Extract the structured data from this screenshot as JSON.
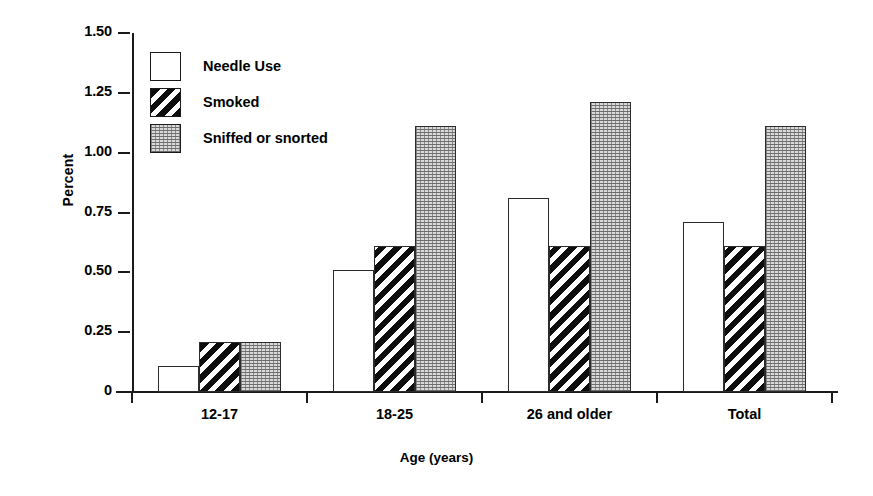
{
  "chart_data": {
    "type": "bar",
    "title": "",
    "xlabel": "Age (years)",
    "ylabel": "Percent",
    "categories": [
      "12-17",
      "18-25",
      "26 and older",
      "Total"
    ],
    "series": [
      {
        "name": "Needle Use",
        "fill": "plain",
        "values": [
          0.11,
          0.51,
          0.81,
          0.71
        ]
      },
      {
        "name": "Smoked",
        "fill": "hatch",
        "values": [
          0.21,
          0.61,
          0.61,
          0.61
        ]
      },
      {
        "name": "Sniffed or snorted",
        "fill": "stipple",
        "values": [
          0.21,
          1.11,
          1.21,
          1.11
        ]
      }
    ],
    "ylim": [
      0,
      1.5
    ],
    "yticks": [
      0,
      0.25,
      0.5,
      0.75,
      1.0,
      1.25,
      1.5
    ],
    "ytick_labels": [
      "0",
      "0.25",
      "0.50",
      "0.75",
      "1.00",
      "1.25",
      "1.50"
    ],
    "grid": false,
    "legend_position": "upper-left-inside",
    "colors": {
      "axis": "#1a1a1a",
      "bar_outline": "#2b2b2b",
      "plain_fill": "#ffffff",
      "hatch_fill": "#0d0d0d",
      "stipple_fill": "#d9d9d9",
      "background": "#ffffff"
    }
  }
}
